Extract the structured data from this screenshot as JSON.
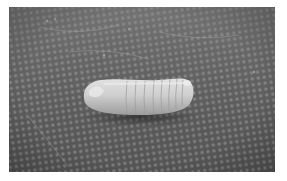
{
  "image": {
    "kind": "grayscale photograph",
    "subject": "larva",
    "description": "Pale, segmented insect larva lying on a dark textured mesh surface",
    "colors": {
      "margin": "#ffffff",
      "surface_dark": "#4a4a4a",
      "surface_mid": "#6e6e6e",
      "surface_light": "#8c8c8c",
      "larva_light": "#d8d8d8",
      "larva_mid": "#b9b9b9",
      "larva_shadow": "#8a8a8a"
    },
    "larva": {
      "segments": 9
    }
  }
}
